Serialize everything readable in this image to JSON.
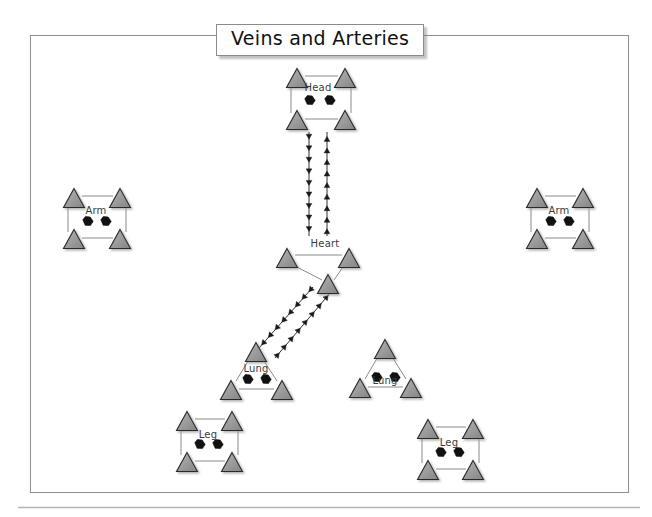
{
  "canvas": {
    "width": 652,
    "height": 517,
    "background": "#ffffff"
  },
  "frame": {
    "name": "diagram-frame",
    "x": 30,
    "y": 35,
    "width": 598,
    "height": 457,
    "stroke": "#8e8e8e",
    "stroke_width": 1
  },
  "footer_rule": {
    "name": "footer-rule",
    "x1": 18,
    "y1": 507,
    "x2": 640,
    "y2": 507,
    "stroke": "#b4b4b4"
  },
  "title": {
    "text": "Veins and Arteries",
    "x": 216,
    "y": 24
  },
  "colors": {
    "triangle_fill": "#9a9a9a",
    "triangle_stroke": "#2b2b2b",
    "connector": "#8a8a8a",
    "arrow": "#1a1a1a",
    "blob": "#111111",
    "label": "#3b3b3b",
    "frame": "#8e8e8e"
  },
  "nodes": [
    {
      "id": "head",
      "label": "Head",
      "shape": "square",
      "label_x": 318,
      "label_y": 82,
      "triangles": [
        {
          "cx": 297,
          "cy": 78
        },
        {
          "cx": 345,
          "cy": 78
        },
        {
          "cx": 297,
          "cy": 120
        },
        {
          "cx": 345,
          "cy": 120
        }
      ],
      "connectors": [
        {
          "x1": 305,
          "y1": 76,
          "x2": 338,
          "y2": 76
        },
        {
          "x1": 305,
          "y1": 119,
          "x2": 338,
          "y2": 119
        },
        {
          "x1": 291,
          "y1": 84,
          "x2": 291,
          "y2": 113
        },
        {
          "x1": 351,
          "y1": 84,
          "x2": 351,
          "y2": 113
        }
      ],
      "blobs": [
        {
          "cx": 310,
          "cy": 100
        },
        {
          "cx": 330,
          "cy": 100
        }
      ]
    },
    {
      "id": "arm-left",
      "label": "Arm",
      "shape": "square",
      "label_x": 96,
      "label_y": 205,
      "triangles": [
        {
          "cx": 74,
          "cy": 198
        },
        {
          "cx": 120,
          "cy": 198
        },
        {
          "cx": 74,
          "cy": 239
        },
        {
          "cx": 120,
          "cy": 239
        }
      ],
      "connectors": [
        {
          "x1": 82,
          "y1": 196,
          "x2": 113,
          "y2": 196
        },
        {
          "x1": 82,
          "y1": 238,
          "x2": 113,
          "y2": 238
        },
        {
          "x1": 68,
          "y1": 204,
          "x2": 68,
          "y2": 232
        },
        {
          "x1": 126,
          "y1": 204,
          "x2": 126,
          "y2": 232
        }
      ],
      "blobs": [
        {
          "cx": 88,
          "cy": 221
        },
        {
          "cx": 106,
          "cy": 221
        }
      ]
    },
    {
      "id": "arm-right",
      "label": "Arm",
      "shape": "square",
      "label_x": 559,
      "label_y": 205,
      "triangles": [
        {
          "cx": 537,
          "cy": 198
        },
        {
          "cx": 583,
          "cy": 198
        },
        {
          "cx": 537,
          "cy": 239
        },
        {
          "cx": 583,
          "cy": 239
        }
      ],
      "connectors": [
        {
          "x1": 545,
          "y1": 196,
          "x2": 576,
          "y2": 196
        },
        {
          "x1": 545,
          "y1": 238,
          "x2": 576,
          "y2": 238
        },
        {
          "x1": 531,
          "y1": 204,
          "x2": 531,
          "y2": 232
        },
        {
          "x1": 589,
          "y1": 204,
          "x2": 589,
          "y2": 232
        }
      ],
      "blobs": [
        {
          "cx": 551,
          "cy": 221
        },
        {
          "cx": 569,
          "cy": 221
        }
      ]
    },
    {
      "id": "heart",
      "label": "Heart",
      "shape": "triangle-down",
      "label_x": 325,
      "label_y": 238,
      "triangles": [
        {
          "cx": 287,
          "cy": 258
        },
        {
          "cx": 349,
          "cy": 258
        },
        {
          "cx": 328,
          "cy": 284
        }
      ],
      "connectors": [
        {
          "x1": 295,
          "y1": 255,
          "x2": 342,
          "y2": 255
        },
        {
          "x1": 291,
          "y1": 264,
          "x2": 322,
          "y2": 280
        },
        {
          "x1": 345,
          "y1": 264,
          "x2": 334,
          "y2": 280
        }
      ],
      "blobs": []
    },
    {
      "id": "lung-left",
      "label": "Lung",
      "shape": "triangle-up",
      "label_x": 256,
      "label_y": 363,
      "triangles": [
        {
          "cx": 256,
          "cy": 352
        },
        {
          "cx": 231,
          "cy": 390
        },
        {
          "cx": 282,
          "cy": 390
        }
      ],
      "connectors": [
        {
          "x1": 250,
          "y1": 358,
          "x2": 236,
          "y2": 381
        },
        {
          "x1": 262,
          "y1": 358,
          "x2": 277,
          "y2": 381
        },
        {
          "x1": 239,
          "y1": 389,
          "x2": 274,
          "y2": 389
        }
      ],
      "blobs": [
        {
          "cx": 248,
          "cy": 379
        },
        {
          "cx": 266,
          "cy": 379
        }
      ]
    },
    {
      "id": "lung-right",
      "label": "Lung",
      "shape": "triangle-up",
      "label_x": 385,
      "label_y": 375,
      "triangles": [
        {
          "cx": 385,
          "cy": 349
        },
        {
          "cx": 360,
          "cy": 388
        },
        {
          "cx": 411,
          "cy": 388
        }
      ],
      "connectors": [
        {
          "x1": 379,
          "y1": 355,
          "x2": 365,
          "y2": 379
        },
        {
          "x1": 391,
          "y1": 355,
          "x2": 406,
          "y2": 379
        },
        {
          "x1": 368,
          "y1": 387,
          "x2": 403,
          "y2": 387
        }
      ],
      "blobs": [
        {
          "cx": 377,
          "cy": 377
        },
        {
          "cx": 395,
          "cy": 377
        }
      ]
    },
    {
      "id": "leg-left",
      "label": "Leg",
      "shape": "square",
      "label_x": 208,
      "label_y": 429,
      "triangles": [
        {
          "cx": 187,
          "cy": 421
        },
        {
          "cx": 232,
          "cy": 421
        },
        {
          "cx": 187,
          "cy": 462
        },
        {
          "cx": 232,
          "cy": 462
        }
      ],
      "connectors": [
        {
          "x1": 195,
          "y1": 419,
          "x2": 225,
          "y2": 419
        },
        {
          "x1": 195,
          "y1": 461,
          "x2": 225,
          "y2": 461
        },
        {
          "x1": 181,
          "y1": 427,
          "x2": 181,
          "y2": 455
        },
        {
          "x1": 238,
          "y1": 427,
          "x2": 238,
          "y2": 455
        }
      ],
      "blobs": [
        {
          "cx": 200,
          "cy": 444
        },
        {
          "cx": 218,
          "cy": 444
        }
      ]
    },
    {
      "id": "leg-right",
      "label": "Leg",
      "shape": "square",
      "label_x": 449,
      "label_y": 437,
      "triangles": [
        {
          "cx": 428,
          "cy": 429
        },
        {
          "cx": 473,
          "cy": 429
        },
        {
          "cx": 428,
          "cy": 470
        },
        {
          "cx": 473,
          "cy": 470
        }
      ],
      "connectors": [
        {
          "x1": 436,
          "y1": 427,
          "x2": 466,
          "y2": 427
        },
        {
          "x1": 436,
          "y1": 469,
          "x2": 466,
          "y2": 469
        },
        {
          "x1": 422,
          "y1": 435,
          "x2": 422,
          "y2": 463
        },
        {
          "x1": 479,
          "y1": 435,
          "x2": 479,
          "y2": 463
        }
      ],
      "blobs": [
        {
          "cx": 441,
          "cy": 452
        },
        {
          "cx": 459,
          "cy": 452
        }
      ]
    }
  ],
  "flows": [
    {
      "id": "head-to-heart",
      "from": "head",
      "to": "heart",
      "direction": "down",
      "x1": 309,
      "y1": 132,
      "x2": 309,
      "y2": 236,
      "arrow_count": 9
    },
    {
      "id": "heart-to-head",
      "from": "heart",
      "to": "head",
      "direction": "up",
      "x1": 327,
      "y1": 236,
      "x2": 327,
      "y2": 132,
      "arrow_count": 9
    },
    {
      "id": "heart-to-lung",
      "from": "heart",
      "to": "lung-left",
      "direction": "down-left",
      "x1": 313,
      "y1": 287,
      "x2": 259,
      "y2": 348,
      "arrow_count": 8
    },
    {
      "id": "lung-to-heart",
      "from": "lung-left",
      "to": "heart",
      "direction": "up-right",
      "x1": 275,
      "y1": 358,
      "x2": 331,
      "y2": 292,
      "arrow_count": 8
    }
  ]
}
